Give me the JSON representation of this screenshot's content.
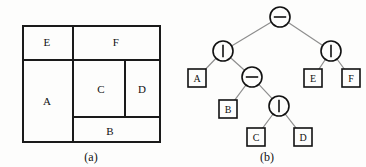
{
  "figure": {
    "width": 366,
    "height": 167,
    "background_color": "#fdfdfc",
    "line_color": "#1a1a1a",
    "edge_color": "#8d8d8d"
  },
  "panel_a": {
    "caption": "(a)",
    "caption_x": 91,
    "caption_y": 150,
    "outline": {
      "x": 22,
      "y": 25,
      "width": 139,
      "height": 118
    },
    "rooms": [
      {
        "name": "A",
        "label": "A",
        "cx": 47,
        "cy": 101
      },
      {
        "name": "B",
        "label": "B",
        "cx": 110,
        "cy": 131
      },
      {
        "name": "C",
        "label": "C",
        "cx": 101,
        "cy": 89
      },
      {
        "name": "D",
        "label": "D",
        "cx": 142,
        "cy": 89
      },
      {
        "name": "E",
        "label": "E",
        "cx": 47,
        "cy": 42
      },
      {
        "name": "F",
        "label": "F",
        "cx": 116,
        "cy": 42
      }
    ],
    "cuts": [
      {
        "name": "top-bottom-cut",
        "orientation": "horizontal",
        "x": 22,
        "y": 59,
        "length": 139
      },
      {
        "name": "e-f-cut",
        "orientation": "vertical",
        "x": 72,
        "y": 25,
        "length": 34
      },
      {
        "name": "a-rest-cut",
        "orientation": "vertical",
        "x": 72,
        "y": 61,
        "length": 82
      },
      {
        "name": "b-upper-cut",
        "orientation": "horizontal",
        "x": 72,
        "y": 116,
        "length": 89
      },
      {
        "name": "c-d-cut",
        "orientation": "vertical",
        "x": 124,
        "y": 61,
        "length": 57
      }
    ]
  },
  "panel_b": {
    "caption": "(b)",
    "caption_x": 84,
    "caption_y": 150,
    "legend": {
      "horizontal_cut_symbol": "−",
      "vertical_cut_symbol": "|"
    },
    "nodes": [
      {
        "id": "n0",
        "name": "root-horizontal-cut-node",
        "type": "operator",
        "operator": "horizontal-cut",
        "glyph": "minus",
        "cx": 97,
        "cy": 17,
        "r": 10
      },
      {
        "id": "n1",
        "name": "left-vertical-cut-node",
        "type": "operator",
        "operator": "vertical-cut",
        "glyph": "bar",
        "cx": 40,
        "cy": 51,
        "r": 10
      },
      {
        "id": "n2",
        "name": "right-vertical-cut-node",
        "type": "operator",
        "operator": "vertical-cut",
        "glyph": "bar",
        "cx": 148,
        "cy": 51,
        "r": 10
      },
      {
        "id": "n3",
        "name": "inner-horizontal-cut-node",
        "type": "operator",
        "operator": "horizontal-cut",
        "glyph": "minus",
        "cx": 69,
        "cy": 77,
        "r": 10
      },
      {
        "id": "n4",
        "name": "inner-vertical-cut-node",
        "type": "operator",
        "operator": "vertical-cut",
        "glyph": "bar",
        "cx": 96,
        "cy": 106,
        "r": 10
      }
    ],
    "leaves": [
      {
        "id": "lA",
        "name": "leaf-node-a",
        "label": "A",
        "cx": 14,
        "cy": 78
      },
      {
        "id": "lB",
        "name": "leaf-node-b",
        "label": "B",
        "cx": 45,
        "cy": 109
      },
      {
        "id": "lC",
        "name": "leaf-node-c",
        "label": "C",
        "cx": 73,
        "cy": 137
      },
      {
        "id": "lD",
        "name": "leaf-node-d",
        "label": "D",
        "cx": 120,
        "cy": 137
      },
      {
        "id": "lE",
        "name": "leaf-node-e",
        "label": "E",
        "cx": 130,
        "cy": 78
      },
      {
        "id": "lF",
        "name": "leaf-node-f",
        "label": "F",
        "cx": 168,
        "cy": 78
      }
    ],
    "leaf_box": {
      "width": 18,
      "height": 18
    },
    "edges": [
      {
        "name": "edge-root-to-left",
        "from": "n0",
        "to": "n1"
      },
      {
        "name": "edge-root-to-right",
        "from": "n0",
        "to": "n2"
      },
      {
        "name": "edge-left-to-a",
        "from": "n1",
        "to": "lA"
      },
      {
        "name": "edge-left-to-inner",
        "from": "n1",
        "to": "n3"
      },
      {
        "name": "edge-inner-to-b",
        "from": "n3",
        "to": "lB"
      },
      {
        "name": "edge-inner-to-vcut",
        "from": "n3",
        "to": "n4"
      },
      {
        "name": "edge-vcut-to-c",
        "from": "n4",
        "to": "lC"
      },
      {
        "name": "edge-vcut-to-d",
        "from": "n4",
        "to": "lD"
      },
      {
        "name": "edge-right-to-e",
        "from": "n2",
        "to": "lE"
      },
      {
        "name": "edge-right-to-f",
        "from": "n2",
        "to": "lF"
      }
    ]
  }
}
